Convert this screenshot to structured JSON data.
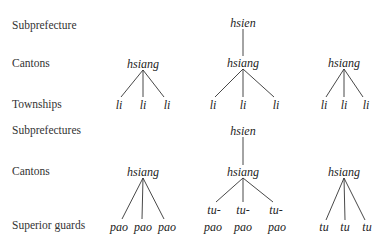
{
  "diagram": {
    "top": {
      "row_labels": [
        "Subprefecture",
        "Cantons",
        "Townships"
      ],
      "trees": [
        {
          "root": null,
          "mid": "hsiang",
          "leaves": [
            "li",
            "li",
            "li"
          ]
        },
        {
          "root": "hsien",
          "mid": "hsiang",
          "leaves": [
            "li",
            "li",
            "li"
          ]
        },
        {
          "root": null,
          "mid": "hsiang",
          "leaves": [
            "li",
            "li",
            "li"
          ]
        }
      ]
    },
    "bottom": {
      "row_labels": [
        "Subprefectures",
        "Cantons",
        "Superior guards"
      ],
      "trees": [
        {
          "root": null,
          "mid": "hsiang",
          "leaves": [
            "pao",
            "pao",
            "pao"
          ]
        },
        {
          "root": "hsien",
          "mid": "hsiang",
          "leaves_top": [
            "tu-",
            "tu-",
            "tu-"
          ],
          "leaves": [
            "pao",
            "pao",
            "pao"
          ]
        },
        {
          "root": null,
          "mid": "hsiang",
          "leaves": [
            "tu",
            "tu",
            "tu"
          ]
        }
      ]
    }
  }
}
